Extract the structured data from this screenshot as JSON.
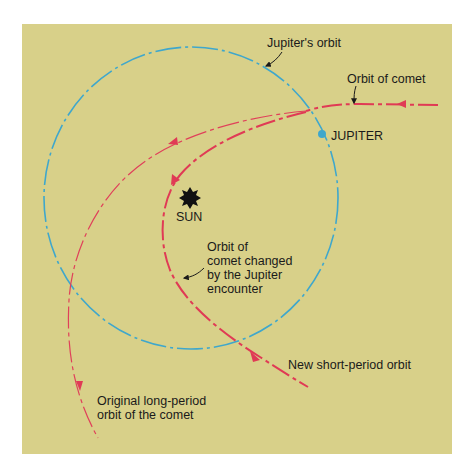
{
  "diagram": {
    "type": "orbital-diagram",
    "colors": {
      "background_panel": "#D8D089",
      "jupiter_orbit": "#3FA7CC",
      "comet_orbit": "#E03A55",
      "sun": "#111111",
      "text": "#1a1a1a"
    },
    "labels": {
      "jupiters_orbit": "Jupiter's orbit",
      "orbit_of_comet": "Orbit of comet",
      "jupiter": "JUPITER",
      "sun": "SUN",
      "changed_orbit": [
        "Orbit of",
        "comet changed",
        "by the Jupiter",
        "encounter"
      ],
      "new_short_period": "New short-period orbit",
      "original_long_period": [
        "Original long-period",
        "orbit of the comet"
      ]
    },
    "objects": {
      "sun": {
        "label": "SUN",
        "icon": "sun-starburst-icon"
      },
      "jupiter": {
        "label": "JUPITER",
        "icon": "planet-dot-icon"
      }
    },
    "paths": [
      {
        "name": "Jupiter's orbit",
        "style": "dashed",
        "color": "#3FA7CC"
      },
      {
        "name": "Incoming comet orbit",
        "style": "dash-dot",
        "color": "#E03A55"
      },
      {
        "name": "Original long-period orbit",
        "style": "dash-dot thin",
        "color": "#E03A55"
      },
      {
        "name": "New short-period orbit",
        "style": "dash-dot thick",
        "color": "#E03A55"
      }
    ]
  }
}
